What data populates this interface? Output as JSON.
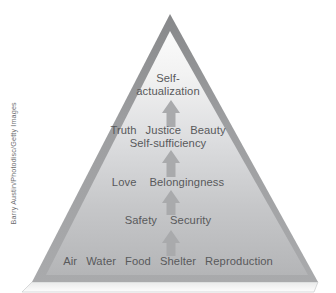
{
  "figure": {
    "title_semantic": "maslow-hierarchy-of-needs-pyramid",
    "background_color": "#ffffff",
    "border_color": "#9a9b9d",
    "interior_top_color": "#f4f4f4",
    "interior_bottom_color": "#b9babc",
    "arrow_color": "#a9aaac",
    "text_color": "#58595b"
  },
  "levels": [
    {
      "id": "self-actualization",
      "line1": "Self-",
      "line2": "actualization"
    },
    {
      "id": "esteem",
      "word1": "Truth",
      "word2": "Justice",
      "word3": "Beauty",
      "line2": "Self-sufficiency"
    },
    {
      "id": "belongingness",
      "word1": "Love",
      "word2": "Belongingness"
    },
    {
      "id": "safety",
      "word1": "Safety",
      "word2": "Security"
    },
    {
      "id": "physiological",
      "word1": "Air",
      "word2": "Water",
      "word3": "Food",
      "word4": "Shelter",
      "word5": "Reproduction"
    }
  ],
  "arrows": [
    {
      "id": "arrow-to-self-actualization"
    },
    {
      "id": "arrow-to-esteem"
    },
    {
      "id": "arrow-to-belongingness"
    },
    {
      "id": "arrow-to-safety"
    }
  ],
  "credit": {
    "text": "Barry Austin/Photodisc/Getty Images"
  }
}
